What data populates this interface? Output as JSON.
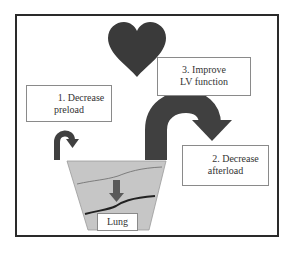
{
  "diagram": {
    "type": "flow",
    "nodes": {
      "heart": {
        "shape": "heart",
        "color": "#3a3a3a"
      },
      "lung": {
        "shape": "trapezoid",
        "label": "Lung",
        "fill": "#c8c8c8"
      }
    },
    "labels": {
      "preload": {
        "line1": "1. Decrease",
        "line2": "preload"
      },
      "afterload": {
        "line1": "2. Decrease",
        "line2": "afterload"
      },
      "lv_function": {
        "line1": "3. Improve",
        "line2": "LV function"
      }
    },
    "arrows": [
      {
        "name": "preload-arrow",
        "from": "lung-left",
        "direction": "curved-down",
        "size": "small"
      },
      {
        "name": "afterload-arrow",
        "from": "lung-right",
        "direction": "curved-right-down",
        "size": "large"
      },
      {
        "name": "fluid-arrow",
        "direction": "down",
        "location": "inside-lung"
      }
    ],
    "colors": {
      "arrow": "#404040",
      "heart": "#3a3a3a",
      "lung_fill": "#c6c6c6",
      "frame": "#2a2a2a"
    }
  }
}
